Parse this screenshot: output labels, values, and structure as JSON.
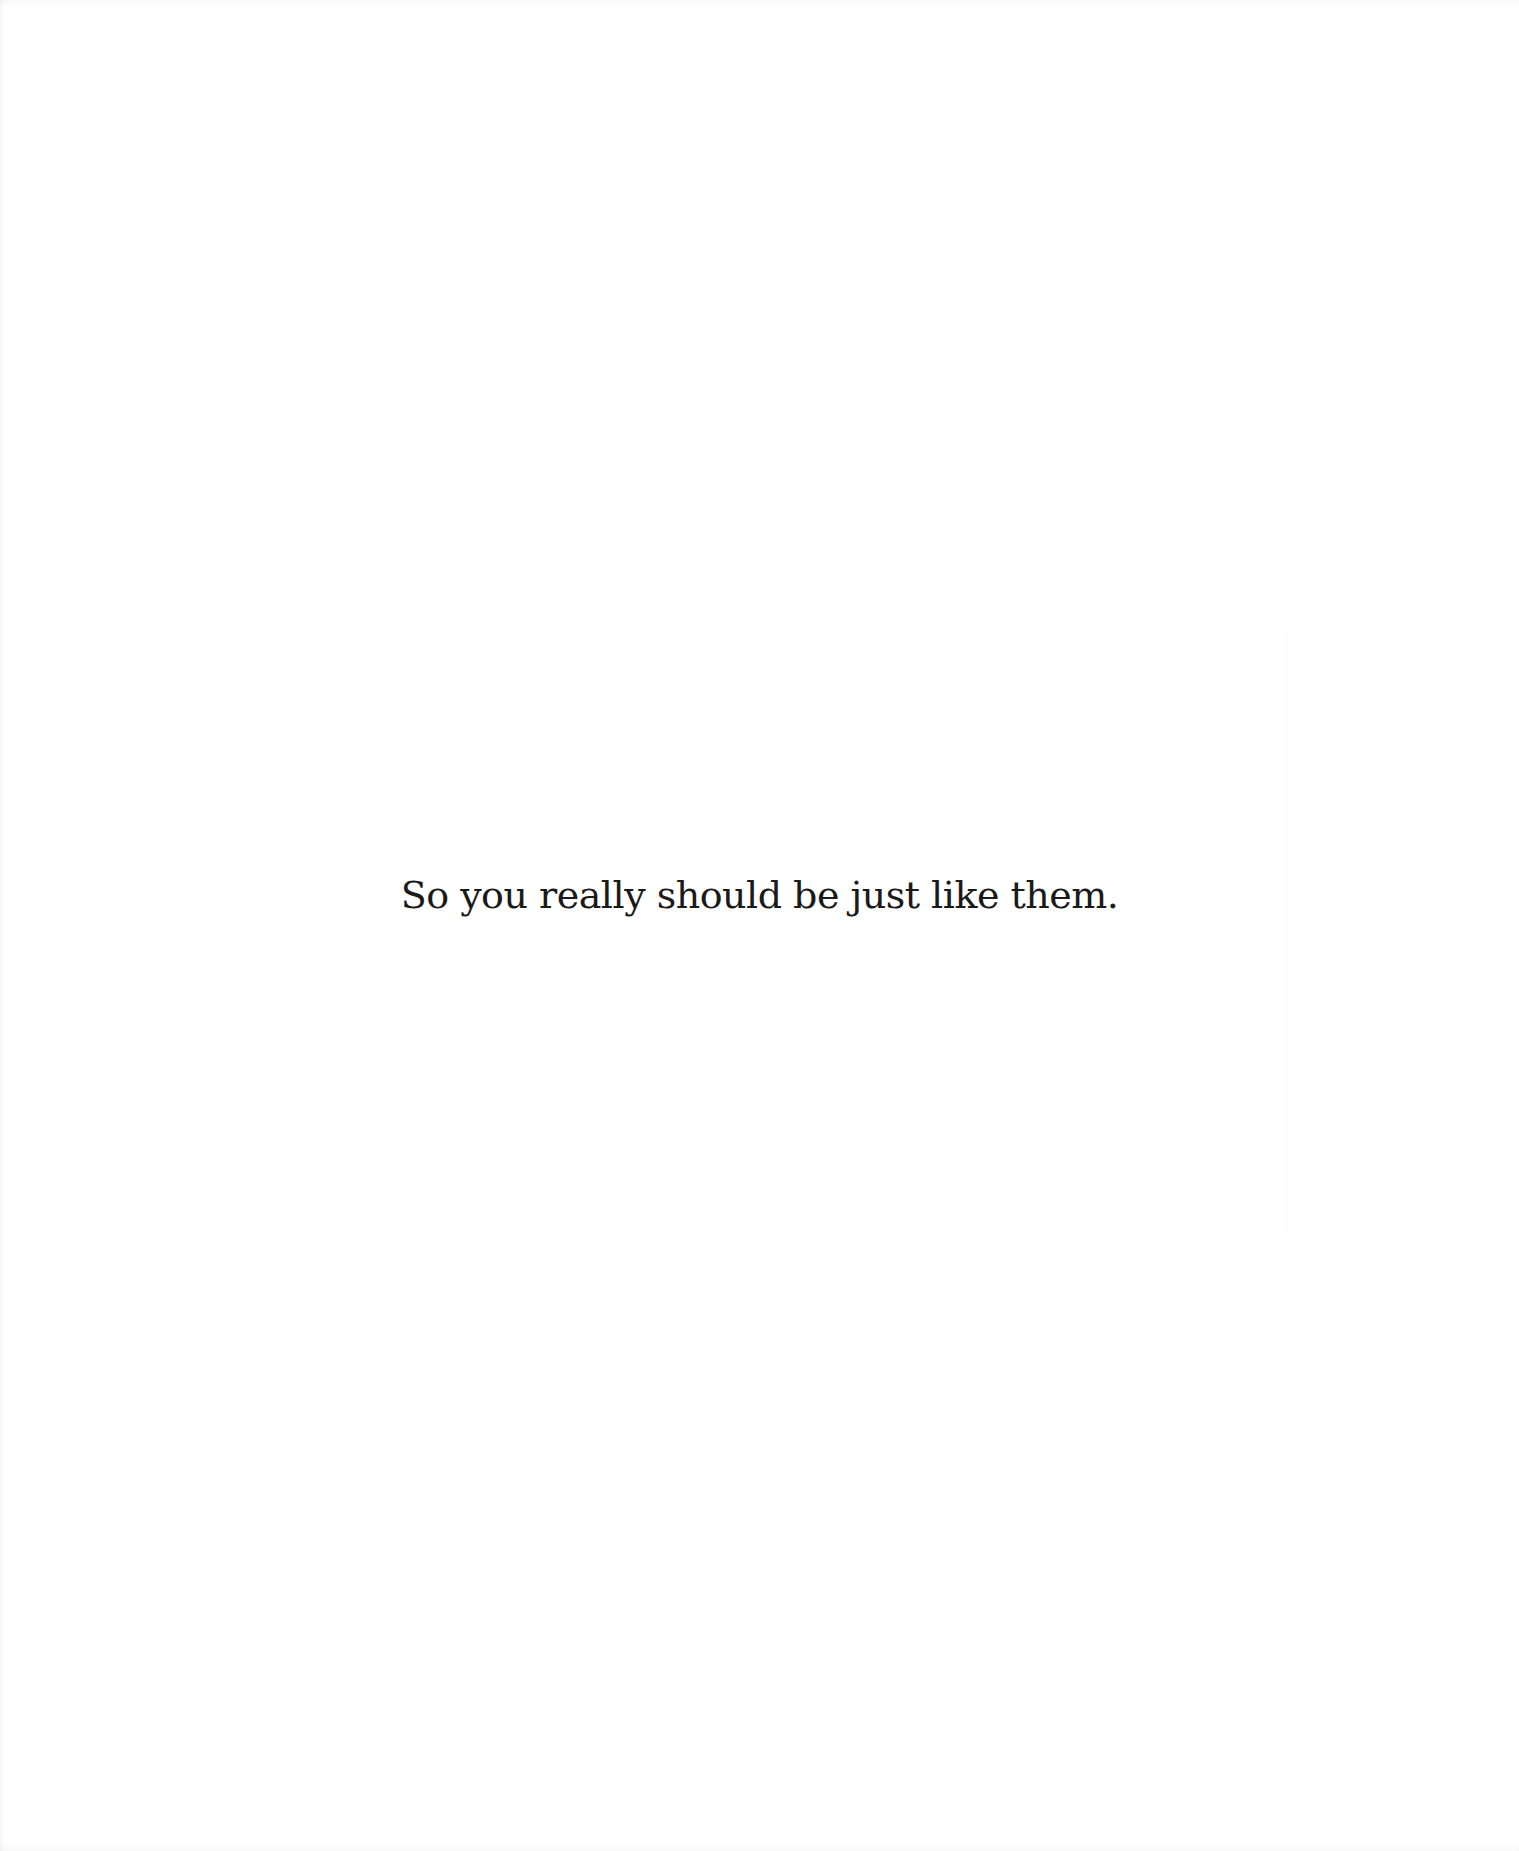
{
  "page": {
    "background_color": "#ffffff",
    "text_color": "#1a1a1a",
    "lines": [
      "So you really should be just like them."
    ]
  }
}
